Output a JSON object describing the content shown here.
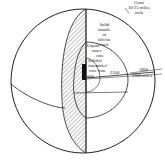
{
  "diagram": {
    "layers": [
      {
        "name": "crust",
        "lines": [
          "Crust",
          "10-25 miles",
          "rock"
        ]
      },
      {
        "name": "mantle",
        "lines": [
          "Solid",
          "mantle",
          "of",
          "olivine",
          "rock"
        ]
      },
      {
        "name": "outer-core",
        "lines": [
          "Liquid",
          "outer",
          "core",
          "of",
          "nickel",
          "iron"
        ]
      },
      {
        "name": "inner-core",
        "lines": [
          "Solid",
          "inner",
          "core"
        ]
      }
    ],
    "measurements": {
      "inner_core": "800",
      "outer_core": "2100",
      "mantle": "1800",
      "radius": "3900 miles"
    },
    "colors": {
      "line": "#222222",
      "background": "#ffffff"
    }
  }
}
